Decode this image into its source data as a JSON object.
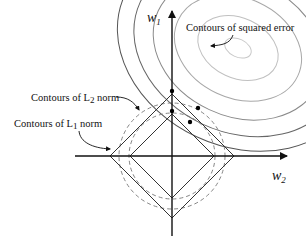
{
  "axes": {
    "horizontal_label": "w",
    "horizontal_subscript": "2",
    "vertical_label": "w",
    "vertical_subscript": "1"
  },
  "annotations": {
    "squared_error": "Contours of squared error",
    "l2_prefix": "Contours of L",
    "l2_subscript": "2",
    "l2_suffix": " norm",
    "l1_prefix": "Contours of L",
    "l1_subscript": "1",
    "l1_suffix": " norm"
  },
  "colors": {
    "axis": "#111111",
    "l1_contour": "#333333",
    "l2_contour": "#777777",
    "error_contour_dark": "#555555",
    "error_contour_light": "#bbbbbb",
    "points": "#000000"
  }
}
